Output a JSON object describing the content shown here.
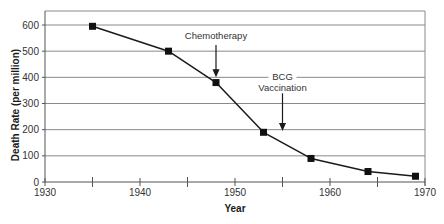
{
  "chart_data": {
    "type": "line",
    "title": "",
    "xlabel": "Year",
    "ylabel": "Death Rate (per million)",
    "x": [
      1935,
      1943,
      1948,
      1953,
      1958,
      1964,
      1969
    ],
    "series": [
      {
        "name": "Death Rate",
        "values": [
          595,
          500,
          380,
          190,
          90,
          40,
          22
        ]
      }
    ],
    "xlim": [
      1930,
      1970
    ],
    "ylim": [
      0,
      650
    ],
    "x_ticks": [
      1930,
      1940,
      1950,
      1960,
      1970
    ],
    "x_minor_ticks": [
      1935,
      1945,
      1955,
      1965
    ],
    "y_ticks": [
      0,
      100,
      200,
      300,
      400,
      500,
      600
    ],
    "grid": {
      "horizontal": true,
      "vertical": false
    },
    "legend": null,
    "annotations": [
      {
        "label": "Chemotherapy",
        "lines": [
          "Chemotherapy"
        ],
        "x": 1948,
        "arrow_tip_value": 400
      },
      {
        "label": "BCG Vaccination",
        "lines": [
          "BCG",
          "Vaccination"
        ],
        "x": 1955,
        "arrow_tip_value": 195
      }
    ],
    "colors": {
      "line": "#1a1a1a",
      "marker": "#111111",
      "grid": "#8a8a8a",
      "axis": "#555555"
    }
  }
}
